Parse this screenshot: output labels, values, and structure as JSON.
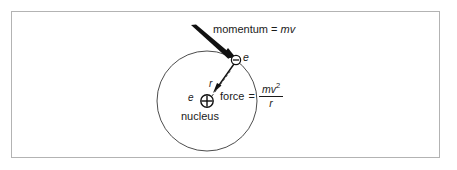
{
  "figure": {
    "type": "physics-diagram",
    "frame_color": "#b3b3b3",
    "ink_color": "#1a1a1a",
    "background": "#ffffff"
  },
  "labels": {
    "momentum_prefix": "momentum = ",
    "momentum_value": "mv",
    "electron_charge": "e",
    "nucleus_charge": "e",
    "nucleus": "nucleus",
    "radius": "r",
    "force_prefix": "force",
    "equals": "=",
    "force_numerator": "mv",
    "force_numerator_exponent": "2",
    "force_denominator": "r"
  },
  "glyphs": {
    "electron_sign": "−",
    "nucleus_sign": "+"
  },
  "geometry": {
    "orbit_center_x": 207,
    "orbit_center_y": 101,
    "orbit_radius": 50,
    "electron_x": 236,
    "electron_y": 60,
    "electron_radius": 4.5,
    "nucleus_x": 207,
    "nucleus_y": 101,
    "nucleus_radius": 6,
    "momentum_arrow_from_x": 192,
    "momentum_arrow_from_y": 26,
    "momentum_arrow_to_x": 233,
    "momentum_arrow_to_y": 56,
    "force_arrow_from_x": 233,
    "force_arrow_from_y": 66,
    "force_arrow_to_x": 215,
    "force_arrow_to_y": 91,
    "radius_line_from_x": 211,
    "radius_line_from_y": 96,
    "radius_line_to_x": 231,
    "radius_line_to_y": 69
  }
}
